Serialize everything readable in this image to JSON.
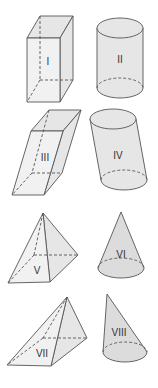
{
  "figure": {
    "shapes": [
      {
        "id": "I",
        "label": "I",
        "type": "right rectangular prism"
      },
      {
        "id": "II",
        "label": "II",
        "type": "right circular cylinder"
      },
      {
        "id": "III",
        "label": "III",
        "type": "oblique rectangular prism"
      },
      {
        "id": "IV",
        "label": "IV",
        "type": "oblique circular cylinder"
      },
      {
        "id": "V",
        "label": "V",
        "type": "right square pyramid"
      },
      {
        "id": "VI",
        "label": "VI",
        "type": "right circular cone"
      },
      {
        "id": "VII",
        "label": "VII",
        "type": "oblique square pyramid"
      },
      {
        "id": "VIII",
        "label": "VIII",
        "type": "oblique circular cone"
      }
    ]
  }
}
